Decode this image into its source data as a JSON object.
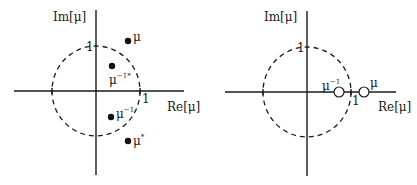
{
  "panels": [
    {
      "name": "left",
      "axis_labels": {
        "x": "Re[μ]",
        "y": "Im[μ]"
      },
      "tick_labels": {
        "x_one": "1",
        "y_one": "1"
      },
      "points": [
        {
          "label": "μ",
          "sup": "",
          "style": "filled"
        },
        {
          "label": "μ",
          "sup": "−1*",
          "style": "filled"
        },
        {
          "label": "μ",
          "sup": "−1",
          "style": "filled"
        },
        {
          "label": "μ",
          "sup": "*",
          "style": "filled"
        }
      ]
    },
    {
      "name": "right",
      "axis_labels": {
        "x": "Re[μ]",
        "y": "Im[μ]"
      },
      "tick_labels": {
        "x_one": "1",
        "y_one": "1"
      },
      "points": [
        {
          "label": "μ",
          "sup": "−1",
          "style": "open"
        },
        {
          "label": "μ",
          "sup": "",
          "style": "open"
        }
      ]
    }
  ],
  "colors": {
    "ink": "#1a1a1a",
    "background": "#ffffff"
  }
}
